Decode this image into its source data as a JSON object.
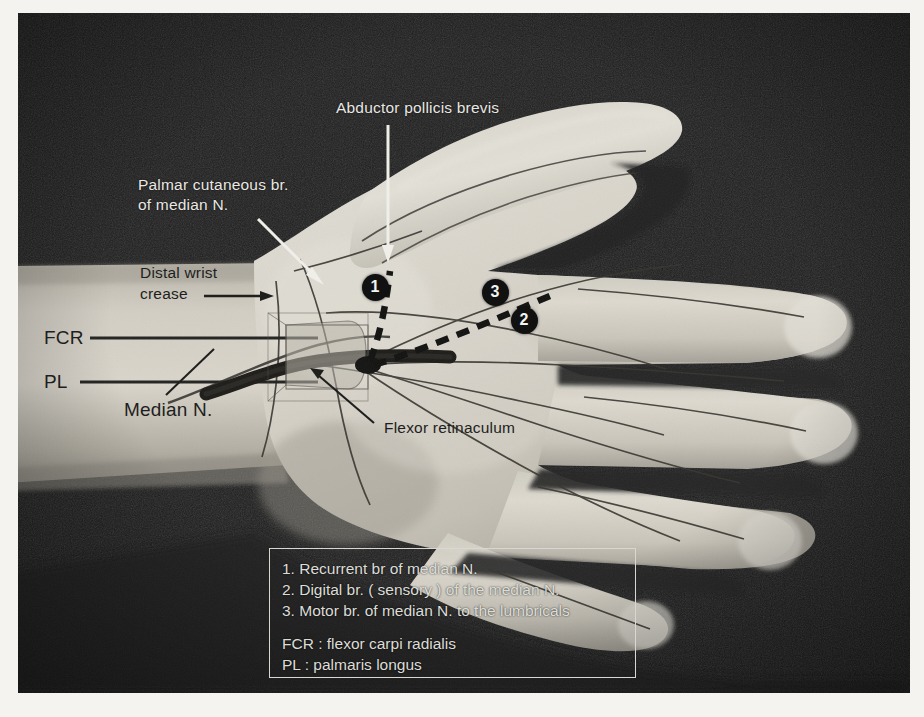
{
  "figure": {
    "plate_background": "#1d1d1d",
    "paper_background": "#f4f3f0",
    "skin_tone_light": "#d9d6cd",
    "skin_tone_mid": "#bdb9ae",
    "skin_tone_shadow": "#8e8a80",
    "annotation_light": "#e9e8e4",
    "annotation_dark": "#1e1e20",
    "marker_fill": "#111112",
    "marker_text": "#f3f3f0"
  },
  "labels": {
    "abductor_pollicis_brevis": "Abductor pollicis brevis",
    "palmar_cutaneous_line1": "Palmar cutaneous br.",
    "palmar_cutaneous_line2": "of median N.",
    "distal_wrist_crease_line1": "Distal wrist",
    "distal_wrist_crease_line2": "crease",
    "fcr": "FCR",
    "pl": "PL",
    "median_nerve": "Median N.",
    "flexor_retinaculum": "Flexor retinaculum"
  },
  "markers": [
    {
      "id": "1",
      "number": "1",
      "x": 375,
      "y": 287
    },
    {
      "id": "3",
      "number": "3",
      "x": 495,
      "y": 292
    },
    {
      "id": "2",
      "number": "2",
      "x": 524,
      "y": 320
    }
  ],
  "legend": {
    "items": [
      "1. Recurrent br of median N.",
      "2. Digital br. ( sensory ) of the median N.",
      "3. Motor br. of median N. to the lumbricals"
    ],
    "abbreviations": [
      "FCR : flexor carpi radialis",
      "PL : palmaris longus"
    ],
    "border_color": "#d8d7d2"
  }
}
